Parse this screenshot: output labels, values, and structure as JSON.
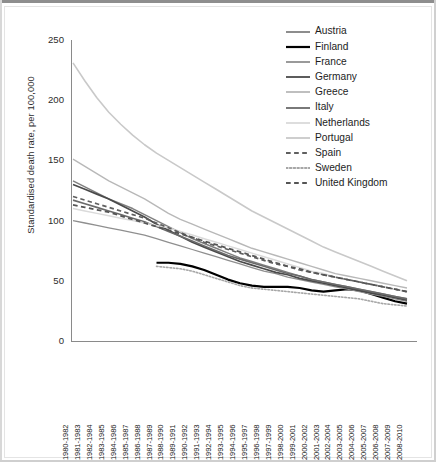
{
  "chart_data": {
    "type": "line",
    "title": "",
    "xlabel": "",
    "ylabel": "Standardised death rate, per 100,000",
    "ylim": [
      0,
      250
    ],
    "yticks": [
      0,
      50,
      100,
      150,
      200,
      250
    ],
    "grid": false,
    "legend_position": "top-right",
    "categories": [
      "1980-1982",
      "1981-1983",
      "1982-1984",
      "1983-1985",
      "1984-1986",
      "1985-1987",
      "1986-1988",
      "1987-1989",
      "1988-1990",
      "1989-1991",
      "1990-1992",
      "1991-1993",
      "1992-1994",
      "1993-1995",
      "1994-1996",
      "1995-1997",
      "1996-1998",
      "1997-1999",
      "1998-2000",
      "1999-2001",
      "2000-2002",
      "2001-2003",
      "2002-2004",
      "2003-2005",
      "2004-2006",
      "2005-2007",
      "2006-2008",
      "2007-2009",
      "2008-2010"
    ],
    "series": [
      {
        "name": "Austria",
        "color": "#808080",
        "style": "solid",
        "width": 1.5,
        "values": [
          133,
          128,
          123,
          118,
          114,
          110,
          105,
          100,
          95,
          90,
          85,
          81,
          77,
          73,
          69,
          66,
          63,
          60,
          57,
          54,
          51,
          49,
          47,
          45,
          43,
          41,
          39,
          37,
          35
        ]
      },
      {
        "name": "Finland",
        "color": "#000000",
        "style": "solid",
        "width": 2.2,
        "values": [
          null,
          null,
          null,
          null,
          null,
          null,
          null,
          65,
          65,
          64,
          62,
          59,
          55,
          51,
          48,
          46,
          45,
          45,
          45,
          44,
          42,
          41,
          42,
          43,
          42,
          39,
          36,
          33,
          31
        ]
      },
      {
        "name": "France",
        "color": "#8f8f8f",
        "style": "solid",
        "width": 1.3,
        "values": [
          100,
          98,
          96,
          94,
          92,
          90,
          88,
          85,
          82,
          79,
          76,
          73,
          70,
          67,
          64,
          61,
          58,
          56,
          53,
          51,
          49,
          47,
          45,
          43,
          41,
          39,
          37,
          35,
          33
        ]
      },
      {
        "name": "Germany",
        "color": "#4a4a4a",
        "style": "solid",
        "width": 1.7,
        "values": [
          130,
          126,
          122,
          118,
          113,
          108,
          103,
          97,
          92,
          87,
          82,
          78,
          74,
          70,
          66,
          63,
          60,
          57,
          55,
          52,
          50,
          48,
          46,
          44,
          42,
          40,
          38,
          36,
          34
        ]
      },
      {
        "name": "Greece",
        "color": "#b8b8b8",
        "style": "solid",
        "width": 1.4,
        "values": [
          151,
          145,
          139,
          133,
          128,
          123,
          118,
          112,
          106,
          101,
          97,
          93,
          89,
          85,
          81,
          77,
          74,
          71,
          68,
          65,
          62,
          59,
          56,
          54,
          52,
          50,
          48,
          46,
          44
        ]
      },
      {
        "name": "Italy",
        "color": "#6a6a6a",
        "style": "solid",
        "width": 1.6,
        "values": [
          117,
          114,
          111,
          108,
          105,
          102,
          99,
          95,
          91,
          87,
          83,
          79,
          75,
          71,
          68,
          65,
          62,
          59,
          56,
          54,
          51,
          49,
          47,
          45,
          43,
          41,
          39,
          37,
          35
        ]
      },
      {
        "name": "Netherlands",
        "color": "#dadada",
        "style": "solid",
        "width": 1.5,
        "values": [
          110,
          108,
          106,
          104,
          102,
          100,
          98,
          96,
          94,
          91,
          88,
          85,
          82,
          79,
          76,
          73,
          70,
          67,
          64,
          61,
          58,
          56,
          53,
          51,
          49,
          47,
          45,
          43,
          41
        ]
      },
      {
        "name": "Portugal",
        "color": "#c9c9c9",
        "style": "solid",
        "width": 1.6,
        "values": [
          231,
          216,
          202,
          190,
          180,
          171,
          163,
          156,
          150,
          144,
          138,
          132,
          126,
          120,
          114,
          108,
          103,
          98,
          93,
          88,
          83,
          78,
          74,
          70,
          66,
          62,
          58,
          54,
          50
        ]
      },
      {
        "name": "Spain",
        "color": "#5f5f5f",
        "style": "dashed",
        "width": 1.7,
        "values": [
          120,
          117,
          114,
          111,
          108,
          105,
          102,
          98,
          94,
          90,
          86,
          82,
          79,
          76,
          73,
          70,
          67,
          64,
          62,
          59,
          57,
          55,
          53,
          51,
          49,
          47,
          45,
          43,
          41
        ]
      },
      {
        "name": "Sweden",
        "color": "#a6a6a6",
        "style": "dotted",
        "width": 1.6,
        "values": [
          null,
          null,
          null,
          null,
          null,
          null,
          null,
          62,
          61,
          60,
          58,
          55,
          52,
          49,
          46,
          44,
          43,
          42,
          41,
          40,
          39,
          38,
          37,
          36,
          35,
          33,
          31,
          30,
          29
        ]
      },
      {
        "name": "United Kingdom",
        "color": "#555555",
        "style": "dashed",
        "width": 1.8,
        "values": [
          113,
          111,
          109,
          107,
          104,
          101,
          98,
          95,
          92,
          89,
          86,
          83,
          80,
          77,
          74,
          71,
          68,
          65,
          62,
          60,
          57,
          55,
          53,
          51,
          49,
          47,
          45,
          43,
          41
        ]
      }
    ]
  }
}
